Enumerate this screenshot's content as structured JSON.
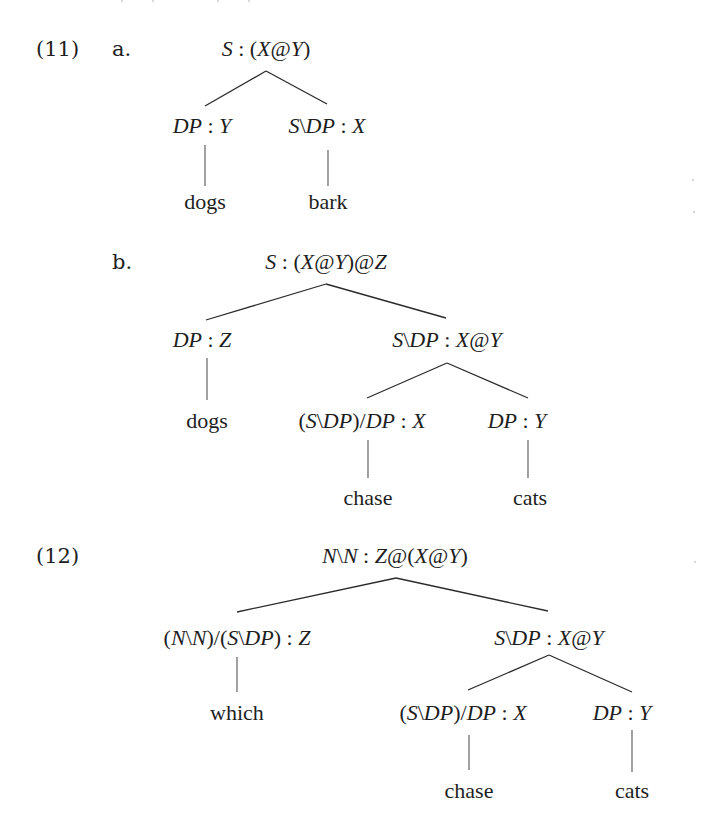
{
  "examples": [
    {
      "number": "(11)",
      "sub": "a.",
      "tree": {
        "root": "S : (X@Y)",
        "children": [
          {
            "label": "DP : Y",
            "leaf": "dogs"
          },
          {
            "label": "S\\DP : X",
            "leaf": "bark"
          }
        ]
      }
    },
    {
      "sub": "b.",
      "tree": {
        "root": "S : (X@Y)@Z",
        "children": [
          {
            "label": "DP : Z",
            "leaf": "dogs"
          },
          {
            "label": "S\\DP : X@Y",
            "children": [
              {
                "label": "(S\\DP)/DP : X",
                "leaf": "chase"
              },
              {
                "label": "DP : Y",
                "leaf": "cats"
              }
            ]
          }
        ]
      }
    },
    {
      "number": "(12)",
      "tree": {
        "root": "N\\N : Z@(X@Y)",
        "children": [
          {
            "label": "(N\\N)/(S\\DP) : Z",
            "leaf": "which"
          },
          {
            "label": "S\\DP : X@Y",
            "children": [
              {
                "label": "(S\\DP)/DP : X",
                "leaf": "chase"
              },
              {
                "label": "DP : Y",
                "leaf": "cats"
              }
            ]
          }
        ]
      }
    }
  ]
}
